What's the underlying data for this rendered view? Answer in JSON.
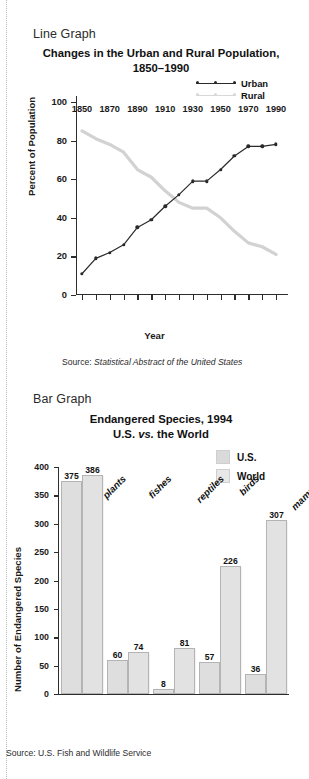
{
  "left_rule": "dotted-guide",
  "line_section": {
    "kicker": "Line Graph",
    "title_line1": "Changes in the Urban and Rural Population,",
    "title_line2": "1850–1990",
    "y_axis_title": "Percent of Population",
    "x_axis_title": "Year",
    "source_prefix": "Source: ",
    "source_italic": "Statistical Abstract of the United States",
    "legend": [
      {
        "label": "Urban",
        "color": "#2a2a2a"
      },
      {
        "label": "Rural",
        "color": "#d2d2d2"
      }
    ]
  },
  "bar_section": {
    "kicker": "Bar Graph",
    "title_line1": "Endangered Species, 1994",
    "title_line2_pre": "U.S. ",
    "title_line2_italic": "vs.",
    "title_line2_post": " the World",
    "y_axis_title": "Number of Endangered Species",
    "source": "Source: U.S. Fish and Wildlife Service",
    "legend": [
      {
        "label": "U.S.",
        "color": "#dedede"
      },
      {
        "label": "World",
        "color": "#e2e2e2"
      }
    ]
  },
  "chart_data": [
    {
      "type": "line",
      "title": "Changes in the Urban and Rural Population, 1850–1990",
      "xlabel": "Year",
      "ylabel": "Percent of Population",
      "xlim": [
        1850,
        1990
      ],
      "ylim": [
        0,
        100
      ],
      "yticks": [
        0,
        20,
        40,
        60,
        80,
        100
      ],
      "ytick_labels": [
        "0",
        "20",
        "40",
        "60",
        "80",
        "100"
      ],
      "xticks": [
        1850,
        1860,
        1870,
        1880,
        1890,
        1900,
        1910,
        1920,
        1930,
        1940,
        1950,
        1960,
        1970,
        1980,
        1990
      ],
      "xtick_labels": [
        "1850",
        "1870",
        "1890",
        "1910",
        "1930",
        "1950",
        "1970",
        "1990"
      ],
      "xtick_labeled_values": [
        1850,
        1870,
        1890,
        1910,
        1930,
        1950,
        1970,
        1990
      ],
      "grid": false,
      "legend_position": "top-right",
      "x": [
        1850,
        1860,
        1870,
        1880,
        1890,
        1900,
        1910,
        1920,
        1930,
        1940,
        1950,
        1960,
        1970,
        1980,
        1990
      ],
      "series": [
        {
          "name": "Urban",
          "color": "#2a2a2a",
          "markers": true,
          "values": [
            11,
            19,
            22,
            26,
            35,
            39,
            46,
            52,
            59,
            59,
            65,
            72,
            77,
            77,
            78
          ]
        },
        {
          "name": "Rural",
          "color": "#d2d2d2",
          "markers": false,
          "values": [
            85,
            81,
            78,
            74,
            65,
            61,
            54,
            48,
            45,
            45,
            40,
            33,
            27,
            25,
            21
          ]
        }
      ],
      "source": "Source: Statistical Abstract of the United States"
    },
    {
      "type": "bar",
      "title": "Endangered Species, 1994 — U.S. vs. the World",
      "xlabel": "",
      "ylabel": "Number of Endangered Species",
      "ylim": [
        0,
        400
      ],
      "yticks": [
        0,
        50,
        100,
        150,
        200,
        250,
        300,
        350,
        400
      ],
      "ytick_labels": [
        "0",
        "50",
        "100",
        "150",
        "200",
        "250",
        "300",
        "350",
        "400"
      ],
      "grid": false,
      "legend_position": "top-right",
      "categories": [
        "plants",
        "fishes",
        "reptiles",
        "birds",
        "mammals"
      ],
      "series": [
        {
          "name": "U.S.",
          "color": "#dedede",
          "values": [
            375,
            60,
            8,
            57,
            36
          ]
        },
        {
          "name": "World",
          "color": "#e2e2e2",
          "values": [
            386,
            74,
            81,
            226,
            307
          ]
        }
      ],
      "source": "Source: U.S. Fish and Wildlife Service"
    }
  ]
}
